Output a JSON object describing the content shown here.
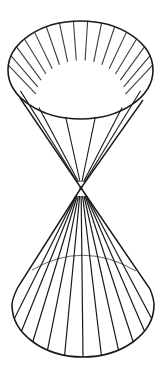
{
  "figure": {
    "colors": {
      "ink": "#1a1a1a",
      "background": "#ffffff"
    },
    "upper_nappe": {
      "ruling_lines": 16,
      "base_visible": "full ellipse (open top)"
    },
    "lower_nappe": {
      "ruling_lines": 12,
      "base_visible": "front arc solid, back arc faint"
    }
  }
}
